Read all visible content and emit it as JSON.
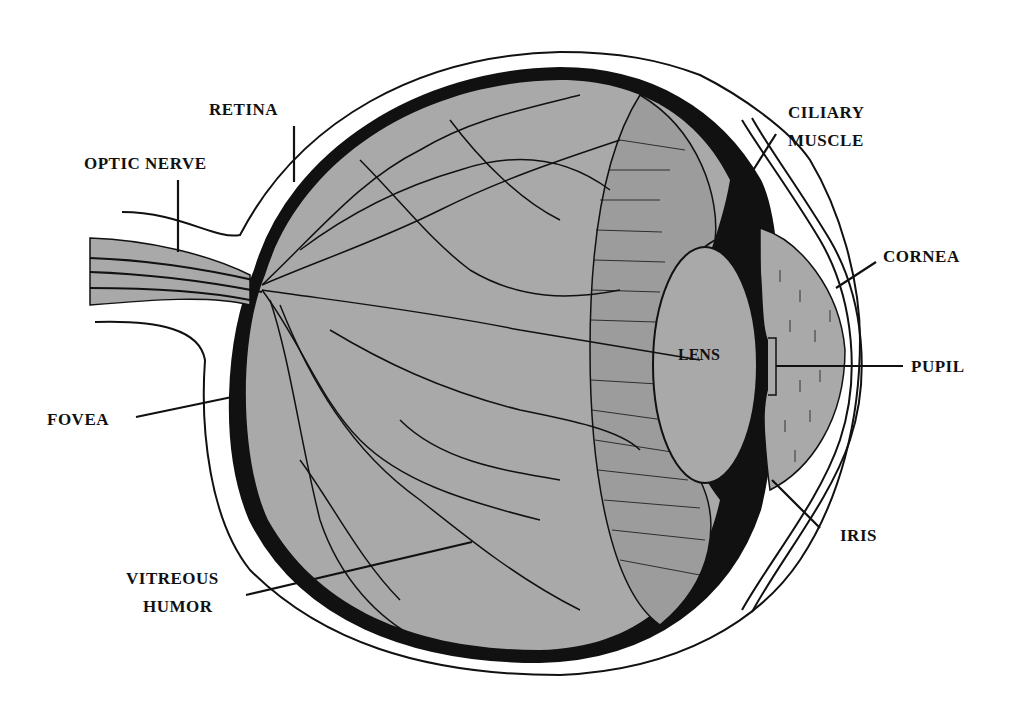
{
  "diagram": {
    "colors": {
      "background": "#ffffff",
      "tissue_fill": "#a9a9a9",
      "ink": "#111111"
    },
    "labels": {
      "retina": "RETINA",
      "optic_nerve": "OPTIC NERVE",
      "ciliary_line1": "CILIARY",
      "ciliary_line2": "MUSCLE",
      "cornea": "CORNEA",
      "lens": "LENS",
      "pupil": "PUPIL",
      "fovea": "FOVEA",
      "iris": "IRIS",
      "vitreous_line1": "VITREOUS",
      "vitreous_line2": "HUMOR"
    }
  }
}
